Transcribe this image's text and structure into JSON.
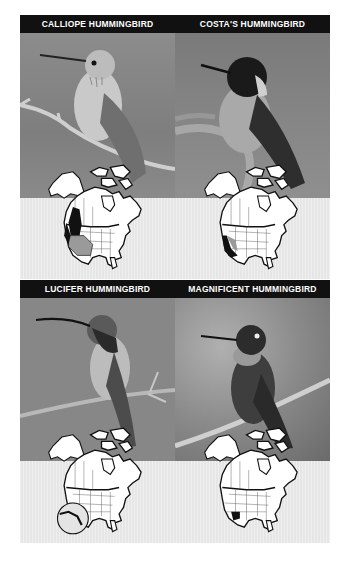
{
  "page": {
    "background": "#ffffff",
    "header_bar_color": "#111111",
    "header_text_color": "#ffffff",
    "range_band_color": "#e6e6e6"
  },
  "species": [
    {
      "name": "CALLIOPE HUMMINGBIRD",
      "photo": {
        "subject": "pale hummingbird perched on twig",
        "background": "#8a8a8a"
      },
      "map": {
        "range_region": "western North America",
        "highlight": [
          "breeding range (dark)",
          "migration range (light)"
        ]
      }
    },
    {
      "name": "COSTA'S HUMMINGBIRD",
      "photo": {
        "subject": "dark-headed hummingbird perched",
        "background": "#7c7c7c"
      },
      "map": {
        "range_region": "southwestern US / Baja California",
        "highlight": [
          "year-round range (dark)",
          "summer range (light)"
        ]
      }
    },
    {
      "name": "LUCIFER HUMMINGBIRD",
      "photo": {
        "subject": "curved-bill hummingbird on thorny branch",
        "background": "#888888"
      },
      "map": {
        "range_region": "west Texas / Mexico (inset circle)",
        "highlight": [
          "range (dark)"
        ]
      }
    },
    {
      "name": "MAGNIFICENT HUMMINGBIRD",
      "photo": {
        "subject": "dark hummingbird on diagonal branch",
        "background": "#9a9a9a"
      },
      "map": {
        "range_region": "Arizona / New Mexico",
        "highlight": [
          "range (dark)"
        ]
      }
    }
  ]
}
